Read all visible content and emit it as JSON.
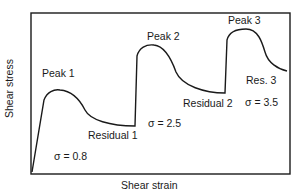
{
  "diagram": {
    "type": "stress-strain schematic",
    "axes": {
      "xlabel": "Shear strain",
      "ylabel": "Shear stress"
    },
    "labels": {
      "peak1": "Peak 1",
      "peak2": "Peak 2",
      "peak3": "Peak 3",
      "residual1": "Residual 1",
      "residual2": "Residual 2",
      "residual3": "Res. 3",
      "sigma1": "σ = 0.8",
      "sigma2": "σ = 2.5",
      "sigma3": "σ = 3.5"
    },
    "colors": {
      "line": "#1a1a1a",
      "background": "#ffffff"
    }
  }
}
